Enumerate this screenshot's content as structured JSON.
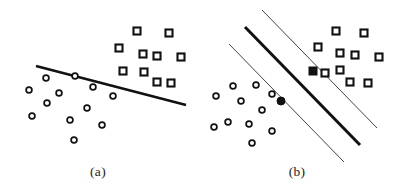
{
  "figure": {
    "title": "",
    "background_color": "#ffffff",
    "ink_color": "#111111",
    "width": 394,
    "height": 191
  },
  "panels": [
    {
      "id": "a",
      "caption": "(a)",
      "caption_x": 98,
      "caption_y": 176
    },
    {
      "id": "b",
      "caption": "(b)",
      "caption_x": 297,
      "caption_y": 176
    }
  ],
  "chart_data": {
    "type": "scatter",
    "title": "",
    "subtitle": "",
    "xlabel": "",
    "ylabel": "",
    "grid": false,
    "legend_position": "none",
    "xlim": [
      0,
      394
    ],
    "ylim": [
      0,
      191
    ],
    "axes_visible": false,
    "annotations": [
      "(a)",
      "(b)"
    ],
    "panels": [
      {
        "id": "a",
        "caption": "(a)",
        "series": [
          {
            "name": "class-circle",
            "marker": "open-circle",
            "marker_size": 7,
            "fill": "#ffffff",
            "stroke": "#111111",
            "points": [
              [
                46,
                78
              ],
              [
                75,
                76
              ],
              [
                29,
                90
              ],
              [
                93,
                87
              ],
              [
                59,
                93
              ],
              [
                113,
                96
              ],
              [
                47,
                103
              ],
              [
                87,
                108
              ],
              [
                32,
                116
              ],
              [
                70,
                120
              ],
              [
                102,
                125
              ],
              [
                74,
                140
              ]
            ]
          },
          {
            "name": "class-square",
            "marker": "open-square",
            "marker_size": 7,
            "fill": "#ffffff",
            "stroke": "#111111",
            "points": [
              [
                137,
                31
              ],
              [
                169,
                33
              ],
              [
                119,
                48
              ],
              [
                143,
                54
              ],
              [
                157,
                56
              ],
              [
                181,
                57
              ],
              [
                123,
                71
              ],
              [
                144,
                72
              ],
              [
                157,
                82
              ],
              [
                171,
                83
              ]
            ]
          }
        ],
        "lines": [
          {
            "name": "separating-line",
            "style": "solid",
            "width": 2.6,
            "color": "#111111",
            "x1": 36,
            "y1": 66,
            "x2": 186,
            "y2": 105
          }
        ]
      },
      {
        "id": "b",
        "caption": "(b)",
        "series": [
          {
            "name": "class-circle",
            "marker": "open-circle",
            "marker_size": 7,
            "fill": "#ffffff",
            "stroke": "#111111",
            "points": [
              [
                233,
                86
              ],
              [
                256,
                85
              ],
              [
                216,
                96
              ],
              [
                272,
                94
              ],
              [
                241,
                101
              ],
              [
                262,
                110
              ],
              [
                228,
                122
              ],
              [
                249,
                124
              ],
              [
                214,
                127
              ],
              [
                272,
                131
              ],
              [
                252,
                143
              ]
            ]
          },
          {
            "name": "class-circle-support",
            "marker": "filled-circle",
            "marker_size": 8,
            "fill": "#111111",
            "stroke": "#111111",
            "points": [
              [
                281,
                101
              ]
            ]
          },
          {
            "name": "class-square",
            "marker": "open-square",
            "marker_size": 7,
            "fill": "#ffffff",
            "stroke": "#111111",
            "points": [
              [
                336,
                31
              ],
              [
                364,
                33
              ],
              [
                318,
                47
              ],
              [
                340,
                53
              ],
              [
                355,
                55
              ],
              [
                379,
                57
              ],
              [
                340,
                70
              ],
              [
                350,
                82
              ],
              [
                368,
                83
              ],
              [
                325,
                73
              ]
            ]
          },
          {
            "name": "class-square-support",
            "marker": "filled-square",
            "marker_size": 8,
            "fill": "#111111",
            "stroke": "#111111",
            "points": [
              [
                313,
                71
              ]
            ]
          }
        ],
        "lines": [
          {
            "name": "maximum-margin-hyperplane",
            "style": "solid",
            "width": 3.0,
            "color": "#111111",
            "x1": 245,
            "y1": 27,
            "x2": 360,
            "y2": 145
          },
          {
            "name": "margin-boundary-upper",
            "style": "solid",
            "width": 1.0,
            "color": "#444444",
            "x1": 262,
            "y1": 10,
            "x2": 377,
            "y2": 128
          },
          {
            "name": "margin-boundary-lower",
            "style": "solid",
            "width": 1.0,
            "color": "#444444",
            "x1": 229,
            "y1": 44,
            "x2": 344,
            "y2": 162
          }
        ]
      }
    ]
  }
}
